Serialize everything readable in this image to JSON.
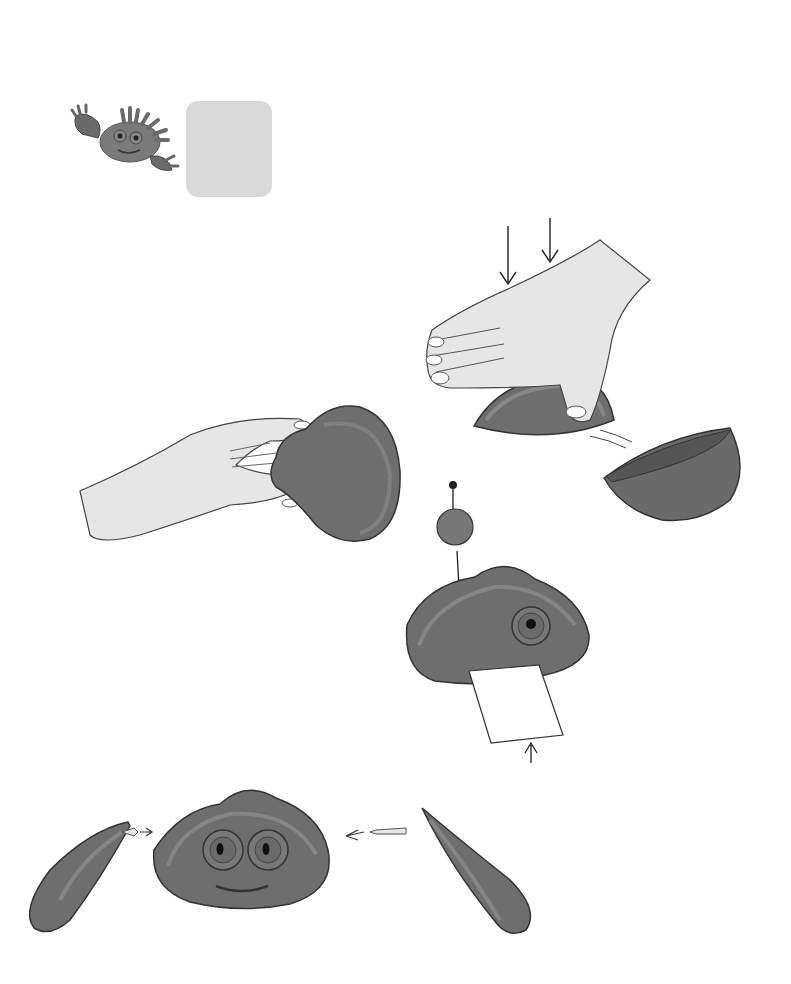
{
  "page": {
    "number": "12",
    "title_initial": "C",
    "title_rest": "rab",
    "title_full": "Crab"
  },
  "border_cubes": {
    "top": [
      "#3c3c3c",
      "#333333",
      "#9a9a9a",
      "#555555",
      "#2e2e2e",
      "#c4c4c4",
      "#2f2f2f",
      "#262626",
      "#a4a4a4",
      "#4a4a4a",
      "#2b2b2b",
      "#d2d2d2"
    ],
    "left": [
      "#3a3a3a",
      "#2f2f2f",
      "#9c9c9c",
      "#555555",
      "#2c2c2c",
      "#bebebe",
      "#2a2a2a",
      "#262626",
      "#a0a0a0"
    ]
  },
  "steps": [
    {
      "number": "1",
      "text_lines": [
        "1. For the body, flatten half a ball with",
        "the palm of your hand."
      ]
    },
    {
      "number": "2",
      "text_lines": [
        "2. Pinch one side with your fingers",
        "to give shape to the rear part."
      ]
    },
    {
      "number": "3",
      "text_lines": [
        "3. For the eyes, make two balls",
        "the same color as the body with",
        "a small black ball in the middle",
        "of each. Make a mouth with",
        "a piece of cardboard."
      ]
    },
    {
      "number": "4",
      "text_lines": [
        "4. Make two pointed",
        "sausages for the",
        "front legs. Using a",
        "piece of toothpick,",
        "join them firmly to",
        "the sides of the",
        "crab. Smooth the",
        "joints with your",
        "finger."
      ]
    }
  ],
  "illustrations": {
    "header_crab": "clay-crab-icon",
    "step1": "hand-flattening-half-ball",
    "step2": "hand-pinching-body",
    "step3": "body-with-eye-and-cardboard-mouth",
    "step4": "body-with-legs-and-toothpicks"
  },
  "colors": {
    "clay": "#6e6e6e",
    "clay_light": "#8a8a8a",
    "clay_dark": "#4e4e4e",
    "skin": "#e4e4e4",
    "step_number": "#c8c8c8",
    "title_box": "#d9d9d9"
  }
}
